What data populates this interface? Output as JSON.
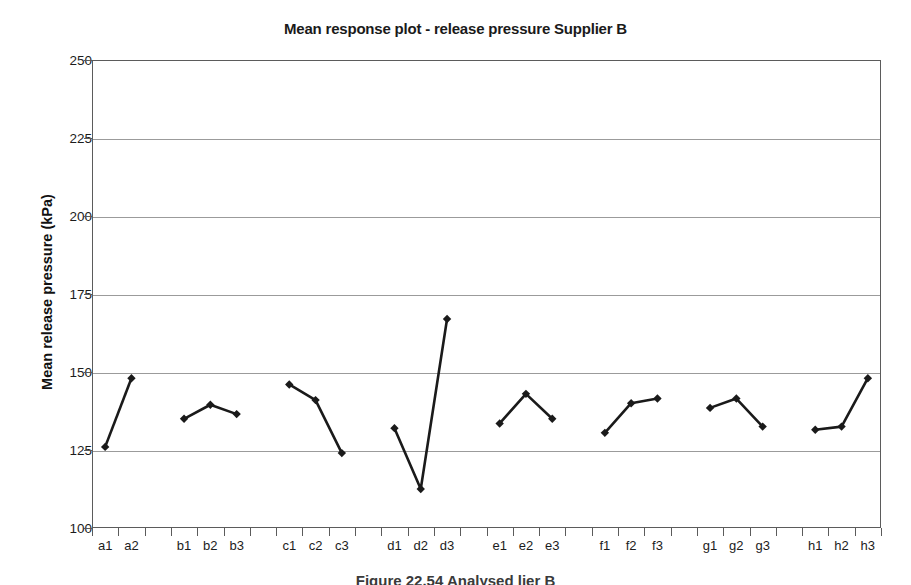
{
  "chart_data": {
    "type": "line",
    "title": "Mean response plot - release pressure Supplier B",
    "xlabel": "",
    "ylabel": "Mean release pressure (kPa)",
    "ylim": [
      100,
      250
    ],
    "ytick_labels": [
      "250",
      "225",
      "200",
      "175",
      "150",
      "125",
      "100"
    ],
    "ytick_values": [
      250,
      225,
      200,
      175,
      150,
      125,
      100
    ],
    "grid": true,
    "legend": "none",
    "marker": "filled-diamond",
    "line_color": "#1a1a1a",
    "categories": [
      "a1",
      "a2",
      "b1",
      "b2",
      "b3",
      "c1",
      "c2",
      "c3",
      "d1",
      "d2",
      "d3",
      "e1",
      "e2",
      "e3",
      "f1",
      "f2",
      "f3",
      "g1",
      "g2",
      "g3",
      "h1",
      "h2",
      "h3"
    ],
    "values": [
      126,
      148,
      135,
      139.5,
      136.5,
      146,
      141,
      124,
      132,
      112.5,
      167,
      133.5,
      143,
      135,
      130.5,
      140,
      141.5,
      138.5,
      141.5,
      132.5,
      131.5,
      132.5,
      148
    ],
    "groups": [
      {
        "name": "a",
        "labels": [
          "a1",
          "a2"
        ],
        "values": [
          126,
          148
        ]
      },
      {
        "name": "b",
        "labels": [
          "b1",
          "b2",
          "b3"
        ],
        "values": [
          135,
          139.5,
          136.5
        ]
      },
      {
        "name": "c",
        "labels": [
          "c1",
          "c2",
          "c3"
        ],
        "values": [
          146,
          141,
          124
        ]
      },
      {
        "name": "d",
        "labels": [
          "d1",
          "d2",
          "d3"
        ],
        "values": [
          132,
          112.5,
          167
        ]
      },
      {
        "name": "e",
        "labels": [
          "e1",
          "e2",
          "e3"
        ],
        "values": [
          133.5,
          143,
          135
        ]
      },
      {
        "name": "f",
        "labels": [
          "f1",
          "f2",
          "f3"
        ],
        "values": [
          130.5,
          140,
          141.5
        ]
      },
      {
        "name": "g",
        "labels": [
          "g1",
          "g2",
          "g3"
        ],
        "values": [
          138.5,
          141.5,
          132.5
        ]
      },
      {
        "name": "h",
        "labels": [
          "h1",
          "h2",
          "h3"
        ],
        "values": [
          131.5,
          132.5,
          148
        ]
      }
    ]
  },
  "caption": "Figure 22.54   Analysed  lier B"
}
